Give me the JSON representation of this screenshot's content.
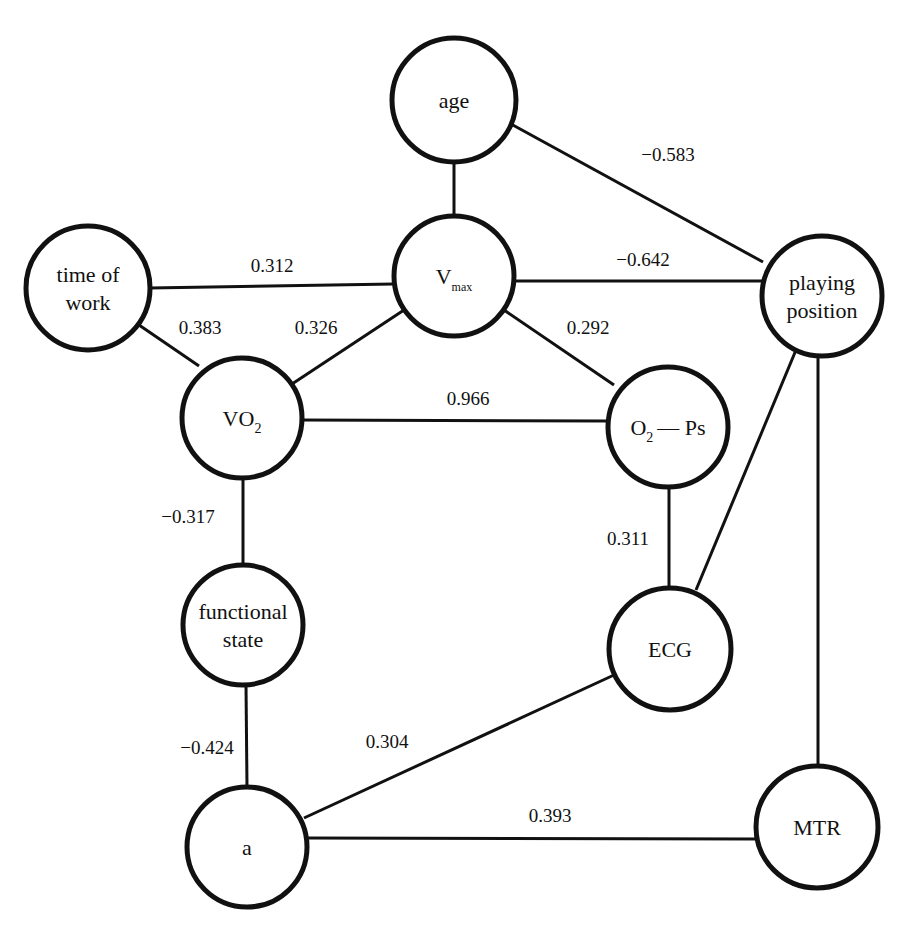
{
  "diagram": {
    "type": "correlation-graph",
    "line_color": "#111111",
    "background": "#ffffff",
    "nodes": [
      {
        "id": "age",
        "lines": [
          "age"
        ],
        "cx": 454,
        "cy": 100,
        "r": 62
      },
      {
        "id": "time_of_work",
        "lines": [
          "time of",
          "work"
        ],
        "cx": 88,
        "cy": 288,
        "r": 62
      },
      {
        "id": "vmax",
        "main": "V",
        "sub": "max",
        "cx": 454,
        "cy": 276,
        "r": 60
      },
      {
        "id": "playing_position",
        "lines": [
          "playing",
          "position"
        ],
        "cx": 822,
        "cy": 296,
        "r": 60
      },
      {
        "id": "vo2",
        "main": "VO",
        "sub": "2",
        "cx": 242,
        "cy": 418,
        "r": 60
      },
      {
        "id": "o2_ps",
        "main": "O",
        "sub": "2",
        "rest": "— Ps",
        "cx": 668,
        "cy": 427,
        "r": 60
      },
      {
        "id": "functional_state",
        "lines": [
          "functional",
          "state"
        ],
        "cx": 243,
        "cy": 625,
        "r": 60
      },
      {
        "id": "ecg",
        "lines": [
          "ECG"
        ],
        "cx": 670,
        "cy": 649,
        "r": 61
      },
      {
        "id": "a",
        "lines": [
          "a"
        ],
        "cx": 247,
        "cy": 847,
        "r": 60
      },
      {
        "id": "mtr",
        "lines": [
          "MTR"
        ],
        "cx": 817,
        "cy": 827,
        "r": 61
      }
    ],
    "edges": [
      {
        "from": "age",
        "to": "vmax",
        "label": "",
        "x1": 454,
        "y1": 162,
        "x2": 454,
        "y2": 216
      },
      {
        "from": "age",
        "to": "playing_position",
        "label": "−0.583",
        "x1": 511,
        "y1": 124,
        "x2": 763,
        "y2": 262,
        "lx": 668,
        "ly": 161
      },
      {
        "from": "time_of_work",
        "to": "vmax",
        "label": "0.312",
        "x1": 150,
        "y1": 288,
        "x2": 394,
        "y2": 284,
        "lx": 272,
        "ly": 272
      },
      {
        "from": "vmax",
        "to": "playing_position",
        "label": "−0.642",
        "x1": 514,
        "y1": 281,
        "x2": 762,
        "y2": 281,
        "lx": 643,
        "ly": 266
      },
      {
        "from": "time_of_work",
        "to": "vo2",
        "label": "0.383",
        "x1": 139,
        "y1": 325,
        "x2": 199,
        "y2": 366,
        "lx": 200,
        "ly": 334
      },
      {
        "from": "vmax",
        "to": "vo2",
        "label": "0.326",
        "x1": 404,
        "y1": 310,
        "x2": 292,
        "y2": 384,
        "lx": 316,
        "ly": 334
      },
      {
        "from": "vmax",
        "to": "o2_ps",
        "label": "0.292",
        "x1": 504,
        "y1": 310,
        "x2": 614,
        "y2": 385,
        "lx": 588,
        "ly": 334
      },
      {
        "from": "vo2",
        "to": "o2_ps",
        "label": "0.966",
        "x1": 302,
        "y1": 420,
        "x2": 608,
        "y2": 421,
        "lx": 468,
        "ly": 405
      },
      {
        "from": "vo2",
        "to": "functional_state",
        "label": "−0.317",
        "x1": 243,
        "y1": 478,
        "x2": 243,
        "y2": 565,
        "lx": 188,
        "ly": 523
      },
      {
        "from": "o2_ps",
        "to": "ecg",
        "label": "0.311",
        "x1": 669,
        "y1": 487,
        "x2": 669,
        "y2": 588,
        "lx": 628,
        "ly": 545
      },
      {
        "from": "playing_position",
        "to": "ecg",
        "label": "",
        "x1": 796,
        "y1": 350,
        "x2": 696,
        "y2": 590
      },
      {
        "from": "playing_position",
        "to": "mtr",
        "label": "",
        "x1": 818,
        "y1": 356,
        "x2": 818,
        "y2": 766
      },
      {
        "from": "functional_state",
        "to": "a",
        "label": "−0.424",
        "x1": 246,
        "y1": 685,
        "x2": 247,
        "y2": 787,
        "lx": 207,
        "ly": 754
      },
      {
        "from": "ecg",
        "to": "a",
        "label": "0.304",
        "x1": 614,
        "y1": 675,
        "x2": 304,
        "y2": 818,
        "lx": 387,
        "ly": 748
      },
      {
        "from": "a",
        "to": "mtr",
        "label": "0.393",
        "x1": 307,
        "y1": 838,
        "x2": 756,
        "y2": 839,
        "lx": 550,
        "ly": 822
      }
    ]
  }
}
